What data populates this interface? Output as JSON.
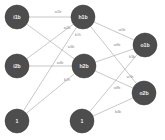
{
  "diagram": {
    "background_color": "#ffffff",
    "node_fill_color": "#4d4d4d",
    "node_text_color": "#f2f2f2",
    "edge_color": "#b0b0b0",
    "edge_label_color": "#8a8a8a",
    "nodes": [
      {
        "id": "i1b",
        "label": "i1b",
        "x": 17,
        "y": 17,
        "r": 12
      },
      {
        "id": "h1b",
        "label": "h1b",
        "x": 83,
        "y": 17,
        "r": 12
      },
      {
        "id": "o1b",
        "label": "o1b",
        "x": 145,
        "y": 45,
        "r": 12
      },
      {
        "id": "i2b",
        "label": "i2b",
        "x": 17,
        "y": 66,
        "r": 12
      },
      {
        "id": "h2b",
        "label": "h2b",
        "x": 84,
        "y": 66,
        "r": 12
      },
      {
        "id": "o2b",
        "label": "o2b",
        "x": 144,
        "y": 93,
        "r": 12
      },
      {
        "id": "b1",
        "label": "1",
        "x": 17,
        "y": 121,
        "r": 12
      },
      {
        "id": "b2",
        "label": "1",
        "x": 82,
        "y": 121,
        "r": 12
      }
    ],
    "edges": [
      {
        "from": "i1b",
        "to": "h1b",
        "label": "w1b",
        "lx": 58,
        "ly": 12
      },
      {
        "from": "i1b",
        "to": "h2b",
        "label": "w3b",
        "lx": 71,
        "ly": 47
      },
      {
        "from": "i2b",
        "to": "h1b",
        "label": "w2b",
        "lx": 67,
        "ly": 28
      },
      {
        "from": "i2b",
        "to": "h2b",
        "label": "w4b",
        "lx": 60,
        "ly": 63
      },
      {
        "from": "b1",
        "to": "h1b",
        "label": "b1h",
        "lx": 78,
        "ly": 35
      },
      {
        "from": "b1",
        "to": "h2b",
        "label": "b2h",
        "lx": 67,
        "ly": 80
      },
      {
        "from": "h1b",
        "to": "o1b",
        "label": "w5b",
        "lx": 122,
        "ly": 30
      },
      {
        "from": "h1b",
        "to": "o2b",
        "label": "w7b",
        "lx": 130,
        "ly": 77
      },
      {
        "from": "h2b",
        "to": "o1b",
        "label": "w6b",
        "lx": 117,
        "ly": 45
      },
      {
        "from": "h2b",
        "to": "o2b",
        "label": "w8b",
        "lx": 117,
        "ly": 88
      },
      {
        "from": "b2",
        "to": "o1b",
        "label": "b3b",
        "lx": 132,
        "ly": 57
      },
      {
        "from": "b2",
        "to": "o2b",
        "label": "b4b",
        "lx": 118,
        "ly": 112
      }
    ]
  }
}
